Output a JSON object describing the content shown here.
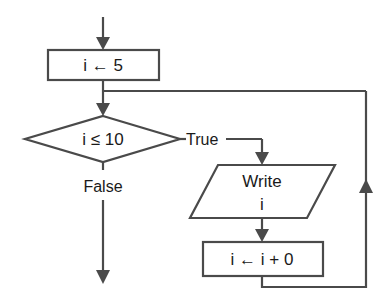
{
  "diagram": {
    "type": "flowchart",
    "nodes": [
      {
        "id": "init",
        "shape": "process",
        "text": "i ← 5"
      },
      {
        "id": "cond",
        "shape": "decision",
        "text": "i ≤ 10"
      },
      {
        "id": "write_line1",
        "shape": "io",
        "text": "Write"
      },
      {
        "id": "write_line2",
        "shape": "io",
        "text": "i"
      },
      {
        "id": "update",
        "shape": "process",
        "text": "i ← i + 0"
      }
    ],
    "edges": [
      {
        "from": "start",
        "to": "init",
        "label": ""
      },
      {
        "from": "init",
        "to": "cond",
        "label": ""
      },
      {
        "from": "cond",
        "to": "write",
        "label": "True"
      },
      {
        "from": "cond",
        "to": "end",
        "label": "False"
      },
      {
        "from": "write",
        "to": "update",
        "label": ""
      },
      {
        "from": "update",
        "to": "cond",
        "label": "loop back"
      }
    ],
    "labels": {
      "true": "True",
      "false": "False"
    },
    "colors": {
      "stroke": "#4a4a4a",
      "text": "#1a1a1a",
      "background": "#ffffff"
    }
  }
}
